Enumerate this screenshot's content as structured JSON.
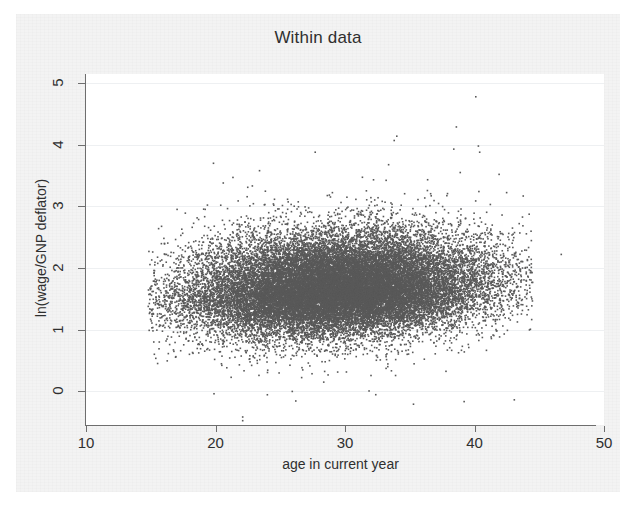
{
  "figure": {
    "title": "Within data",
    "background_color": "#f3f3f3",
    "plot_background_color": "#ffffff",
    "axis_color": "#6e6e6e",
    "text_color": "#2f2f2f"
  },
  "chart_data": {
    "type": "scatter",
    "title": "Within data",
    "xlabel": "age in current year",
    "ylabel": "ln(wage/GNP deflator)",
    "xlim": [
      10,
      50
    ],
    "ylim": [
      -0.55,
      5.15
    ],
    "xticks": [
      10,
      20,
      30,
      40,
      50
    ],
    "yticks": [
      0,
      1,
      2,
      3,
      4,
      5
    ],
    "xtick_labels": [
      "10",
      "20",
      "30",
      "40",
      "50"
    ],
    "ytick_labels": [
      "0",
      "1",
      "2",
      "3",
      "4",
      "5"
    ],
    "grid": true,
    "grid_axis": "y",
    "grid_color": "#eef0f2",
    "legend": false,
    "marker_color": "#595959",
    "marker_size": 1.6,
    "n_points": 28000,
    "series": [
      {
        "name": "within-transformed wage observations",
        "description": "Dense elliptical cloud of ln(wage/GNP deflator) against age in current year, centered near age 30 with mean about 1.65, right-skewed upper tail reaching 4.8.",
        "x_range": [
          14.8,
          44.5
        ],
        "y_range": [
          -0.45,
          4.78
        ],
        "x_mean": 29.5,
        "y_mean": 1.66,
        "x_sd": 5.6,
        "y_sd": 0.36,
        "y_skew": 0.9,
        "core_density_band": [
          1.15,
          2.1
        ],
        "trend": "slight positive drift of upper envelope with age"
      }
    ],
    "outliers": [
      {
        "x": 46.7,
        "y": 2.22,
        "note": "isolated point far right of the cloud"
      },
      {
        "x": 22.1,
        "y": -0.42,
        "note": "pair of low outliers below zero"
      },
      {
        "x": 22.1,
        "y": -0.48,
        "note": "pair of low outliers below zero"
      },
      {
        "x": 40.1,
        "y": 4.78,
        "note": "highest observation"
      },
      {
        "x": 38.6,
        "y": 4.29,
        "note": "high observation"
      },
      {
        "x": 34.0,
        "y": 4.14,
        "note": "high observation"
      },
      {
        "x": 33.8,
        "y": 4.07,
        "note": "high observation"
      },
      {
        "x": 40.3,
        "y": 3.98,
        "note": "high observation"
      },
      {
        "x": 38.4,
        "y": 3.93,
        "note": "high observation"
      },
      {
        "x": 40.4,
        "y": 3.88,
        "note": "high observation"
      },
      {
        "x": 27.7,
        "y": 3.88,
        "note": "high observation"
      },
      {
        "x": 38.9,
        "y": 3.55,
        "note": "high observation"
      },
      {
        "x": 41.9,
        "y": 3.52,
        "note": "high observation"
      },
      {
        "x": 23.4,
        "y": 3.58,
        "note": "high observation young worker"
      },
      {
        "x": 20.6,
        "y": 3.38,
        "note": "high observation young worker"
      },
      {
        "x": 26.2,
        "y": -0.16,
        "note": "low observation"
      },
      {
        "x": 39.2,
        "y": -0.17,
        "note": "low observation"
      }
    ]
  },
  "axes": {
    "x_title": "age in current year",
    "y_title": "ln(wage/GNP deflator)"
  }
}
